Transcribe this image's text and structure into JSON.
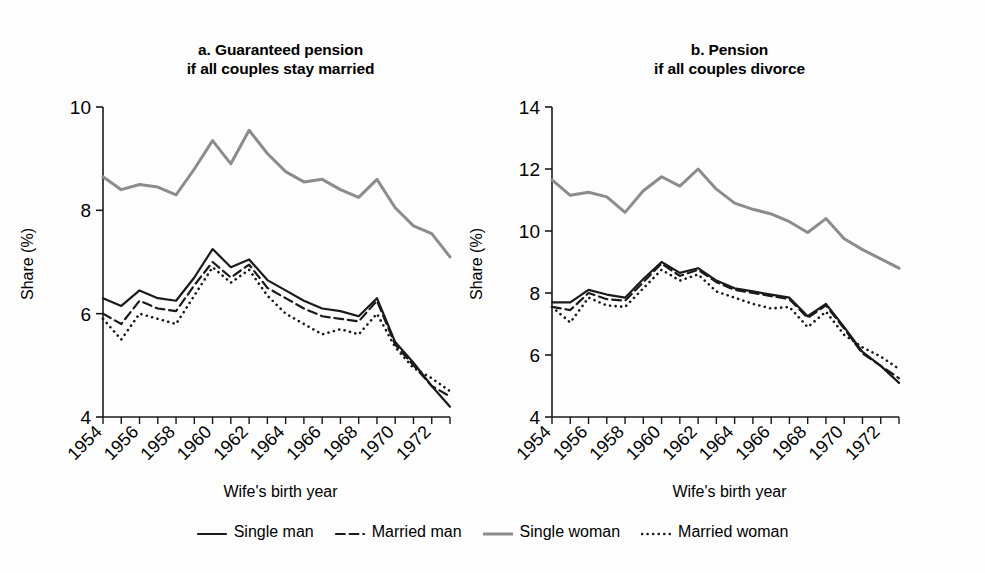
{
  "figure": {
    "background": "#fdfdfd",
    "panels": [
      {
        "id": "a",
        "title": "a. Guaranteed pension\nif all couples stay married",
        "xlabel": "Wife's birth year",
        "ylabel": "Share (%)"
      },
      {
        "id": "b",
        "title": "b. Pension\nif all couples divorce",
        "xlabel": "Wife's birth year",
        "ylabel": "Share (%)"
      }
    ]
  },
  "legend": {
    "position": "bottom-center",
    "items": [
      {
        "label": "Single man",
        "style": "solid",
        "color": "#1a1a1a",
        "width": 2.2
      },
      {
        "label": "Married man",
        "style": "dashed",
        "color": "#1a1a1a",
        "width": 2.2
      },
      {
        "label": "Single woman",
        "style": "solid",
        "color": "#8c8c8c",
        "width": 3.0
      },
      {
        "label": "Married woman",
        "style": "dotted",
        "color": "#1a1a1a",
        "width": 2.6
      }
    ]
  },
  "chart_data": [
    {
      "type": "line",
      "panel": "a",
      "title": "a. Guaranteed pension if all couples stay married",
      "xlabel": "Wife's birth year",
      "ylabel": "Share (%)",
      "x": [
        1954,
        1955,
        1956,
        1957,
        1958,
        1959,
        1960,
        1961,
        1962,
        1963,
        1964,
        1965,
        1966,
        1967,
        1968,
        1969,
        1970,
        1971,
        1972,
        1973
      ],
      "xlim": [
        1954,
        1973
      ],
      "ylim": [
        4,
        10
      ],
      "yticks": [
        4,
        6,
        8,
        10
      ],
      "xticks": [
        1954,
        1956,
        1958,
        1960,
        1962,
        1964,
        1966,
        1968,
        1970,
        1972
      ],
      "xtick_labels": [
        "1954",
        "1956",
        "1958",
        "1960",
        "1962",
        "1964",
        "1966",
        "1968",
        "1970",
        "1972"
      ],
      "ytick_labels": [
        "4",
        "6",
        "8",
        "10"
      ],
      "grid": false,
      "series": [
        {
          "name": "Single man",
          "style": "solid",
          "color": "#1a1a1a",
          "values": [
            6.3,
            6.15,
            6.45,
            6.3,
            6.25,
            6.7,
            7.25,
            6.9,
            7.05,
            6.65,
            6.45,
            6.25,
            6.1,
            6.05,
            5.95,
            6.3,
            5.45,
            5.05,
            4.6,
            4.2
          ]
        },
        {
          "name": "Married man",
          "style": "dashed",
          "color": "#1a1a1a",
          "values": [
            6.0,
            5.8,
            6.25,
            6.1,
            6.05,
            6.55,
            7.0,
            6.7,
            6.95,
            6.5,
            6.3,
            6.1,
            5.95,
            5.9,
            5.85,
            6.25,
            5.4,
            5.0,
            4.6,
            4.4
          ]
        },
        {
          "name": "Single woman",
          "style": "solid",
          "color": "#8c8c8c",
          "values": [
            8.65,
            8.4,
            8.5,
            8.45,
            8.3,
            8.8,
            9.35,
            8.9,
            9.55,
            9.1,
            8.75,
            8.55,
            8.6,
            8.4,
            8.25,
            8.6,
            8.05,
            7.7,
            7.55,
            7.1
          ]
        },
        {
          "name": "Married woman",
          "style": "dotted",
          "color": "#1a1a1a",
          "values": [
            5.9,
            5.5,
            6.0,
            5.9,
            5.8,
            6.35,
            6.9,
            6.6,
            6.85,
            6.35,
            6.0,
            5.8,
            5.6,
            5.7,
            5.6,
            6.0,
            5.35,
            4.95,
            4.75,
            4.5
          ]
        }
      ]
    },
    {
      "type": "line",
      "panel": "b",
      "title": "b. Pension if all couples divorce",
      "xlabel": "Wife's birth year",
      "ylabel": "Share (%)",
      "x": [
        1954,
        1955,
        1956,
        1957,
        1958,
        1959,
        1960,
        1961,
        1962,
        1963,
        1964,
        1965,
        1966,
        1967,
        1968,
        1969,
        1970,
        1971,
        1972,
        1973
      ],
      "xlim": [
        1954,
        1973
      ],
      "ylim": [
        4,
        14
      ],
      "yticks": [
        4,
        6,
        8,
        10,
        12,
        14
      ],
      "xticks": [
        1954,
        1956,
        1958,
        1960,
        1962,
        1964,
        1966,
        1968,
        1970,
        1972
      ],
      "xtick_labels": [
        "1954",
        "1956",
        "1958",
        "1960",
        "1962",
        "1964",
        "1966",
        "1968",
        "1970",
        "1972"
      ],
      "ytick_labels": [
        "4",
        "6",
        "8",
        "10",
        "12",
        "14"
      ],
      "grid": false,
      "series": [
        {
          "name": "Single man",
          "style": "solid",
          "color": "#1a1a1a",
          "values": [
            7.7,
            7.7,
            8.1,
            7.95,
            7.85,
            8.45,
            9.0,
            8.65,
            8.8,
            8.4,
            8.15,
            8.05,
            7.95,
            7.85,
            7.25,
            7.65,
            6.9,
            6.1,
            5.65,
            5.1
          ]
        },
        {
          "name": "Married man",
          "style": "dashed",
          "color": "#1a1a1a",
          "values": [
            7.55,
            7.45,
            8.0,
            7.8,
            7.75,
            8.35,
            8.95,
            8.55,
            8.75,
            8.35,
            8.1,
            8.0,
            7.9,
            7.8,
            7.2,
            7.6,
            6.85,
            6.05,
            5.65,
            5.25
          ]
        },
        {
          "name": "Single woman",
          "style": "solid",
          "color": "#8c8c8c",
          "values": [
            11.65,
            11.15,
            11.25,
            11.1,
            10.6,
            11.3,
            11.75,
            11.45,
            12.0,
            11.35,
            10.9,
            10.7,
            10.55,
            10.3,
            9.95,
            10.4,
            9.75,
            9.4,
            9.1,
            8.8
          ]
        },
        {
          "name": "Married woman",
          "style": "dotted",
          "color": "#1a1a1a",
          "values": [
            7.55,
            7.05,
            7.85,
            7.6,
            7.55,
            8.15,
            8.75,
            8.4,
            8.6,
            8.05,
            7.85,
            7.65,
            7.5,
            7.55,
            6.9,
            7.4,
            6.65,
            6.25,
            5.95,
            5.55
          ]
        }
      ]
    }
  ]
}
